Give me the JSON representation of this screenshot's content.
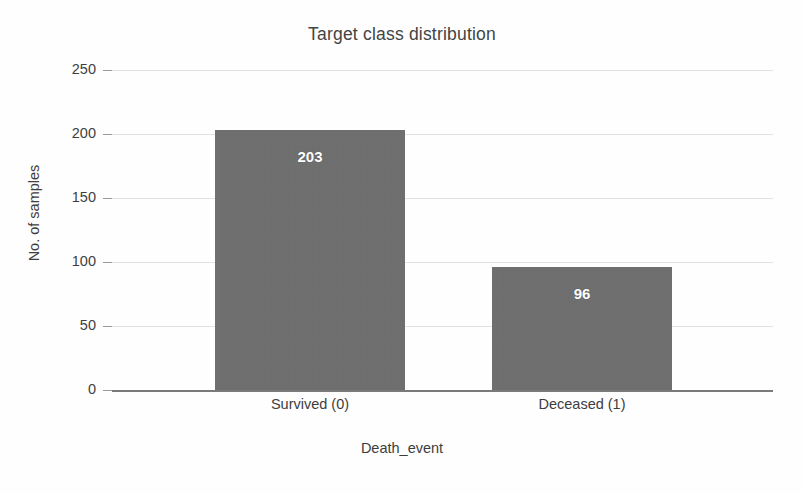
{
  "chart_data": {
    "type": "bar",
    "title": "Target class distribution",
    "xlabel": "Death_event",
    "ylabel": "No. of samples",
    "categories": [
      "Survived (0)",
      "Deceased (1)"
    ],
    "values": [
      203,
      96
    ],
    "value_labels": [
      "203",
      "96"
    ],
    "ylim": [
      0,
      250
    ],
    "yticks": [
      0,
      50,
      100,
      150,
      200,
      250
    ],
    "ytick_labels": [
      "0",
      "50",
      "100",
      "150",
      "200",
      "250"
    ],
    "grid": true,
    "legend": false,
    "colors": {
      "bar_fill": "#6e6e6e",
      "value_label": "#ffffff",
      "gridline": "#e2e2e2",
      "baseline": "#7a7a7a",
      "text": "#3d3d3d",
      "title": "#434343",
      "background": "#fefefe"
    }
  }
}
